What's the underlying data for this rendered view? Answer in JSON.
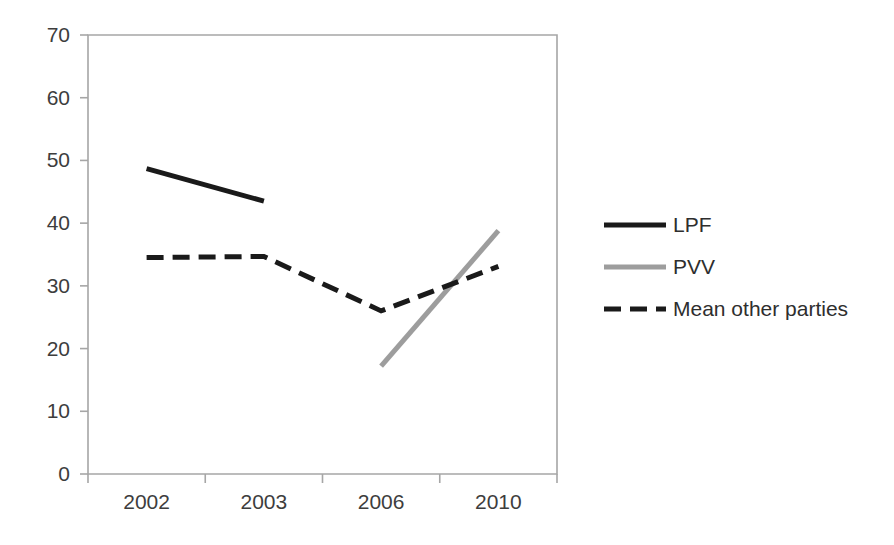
{
  "chart_data": {
    "type": "line",
    "title": "",
    "subtitle": "",
    "xlabel": "",
    "ylabel": "",
    "categories": [
      "2002",
      "2003",
      "2006",
      "2010"
    ],
    "ylim": [
      0,
      70
    ],
    "yticks": [
      0,
      10,
      20,
      30,
      40,
      50,
      60,
      70
    ],
    "ytick_labels": [
      "0",
      "10",
      "20",
      "30",
      "40",
      "50",
      "60",
      "70"
    ],
    "grid": false,
    "legend_position": "right",
    "series": [
      {
        "name": "LPF",
        "color": "#1a1a1a",
        "style": "solid",
        "width": 5,
        "values": [
          48.7,
          43.5,
          null,
          null
        ]
      },
      {
        "name": "PVV",
        "color": "#9d9d9d",
        "style": "solid",
        "width": 5,
        "values": [
          null,
          null,
          17.2,
          38.8
        ]
      },
      {
        "name": "Mean other parties",
        "color": "#1a1a1a",
        "style": "dashed",
        "width": 5,
        "values": [
          34.5,
          34.7,
          26.0,
          33.1
        ]
      }
    ]
  },
  "legend": {
    "items": [
      {
        "label": "LPF"
      },
      {
        "label": "PVV"
      },
      {
        "label": "Mean other parties"
      }
    ]
  },
  "axes": {
    "y_tick_labels": [
      "70",
      "60",
      "50",
      "40",
      "30",
      "20",
      "10",
      "0"
    ],
    "x_tick_labels": [
      "2002",
      "2003",
      "2006",
      "2010"
    ]
  }
}
